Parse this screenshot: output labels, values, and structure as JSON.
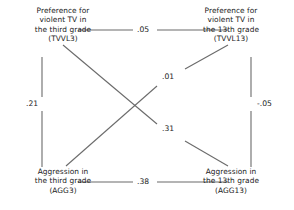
{
  "diagram": {
    "type": "cross-lagged-panel",
    "nodes": [
      {
        "id": "TVVL3",
        "position": "top-left",
        "lines": [
          "Preference for",
          "violent TV in",
          "the third grade",
          "(TVVL3)"
        ]
      },
      {
        "id": "TVVL13",
        "position": "top-right",
        "lines": [
          "Preference for",
          "violent TV in",
          "the 13th grade",
          "(TVVL13)"
        ]
      },
      {
        "id": "AGG3",
        "position": "bottom-left",
        "lines": [
          "Aggression in",
          "the third grade",
          "(AGG3)"
        ]
      },
      {
        "id": "AGG13",
        "position": "bottom-right",
        "lines": [
          "Aggression in",
          "the 13th grade",
          "(AGG13)"
        ]
      }
    ],
    "paths": [
      {
        "id": "top",
        "from": "TVVL3",
        "to": "TVVL13",
        "coefficient": ".05"
      },
      {
        "id": "bottom",
        "from": "AGG3",
        "to": "AGG13",
        "coefficient": ".38"
      },
      {
        "id": "left",
        "from": "TVVL3",
        "to": "AGG3",
        "coefficient": ".21"
      },
      {
        "id": "right",
        "from": "TVVL13",
        "to": "AGG13",
        "coefficient": "-.05"
      },
      {
        "id": "diag-upper",
        "from": "AGG3",
        "to": "TVVL13",
        "coefficient": ".01"
      },
      {
        "id": "diag-lower",
        "from": "TVVL3",
        "to": "AGG13",
        "coefficient": ".31"
      }
    ],
    "style": {
      "line_color": "#6b6b6b",
      "text_color": "#1a1a1a",
      "background": "#ffffff"
    }
  }
}
